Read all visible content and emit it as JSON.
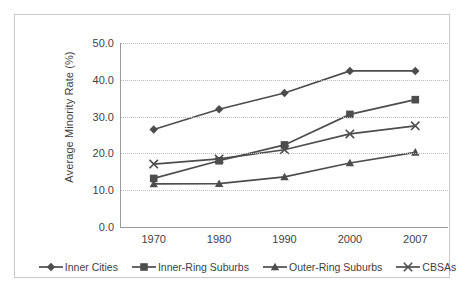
{
  "chart_data": {
    "type": "line",
    "title": "",
    "xlabel": "",
    "ylabel": "Average Minority Rate (%)",
    "categories": [
      "1970",
      "1980",
      "1990",
      "2000",
      "2007"
    ],
    "x": [
      1970,
      1980,
      1990,
      2000,
      2007
    ],
    "ylim": [
      0.0,
      50.0
    ],
    "ytick_labels": [
      "0.0",
      "10.0",
      "20.0",
      "30.0",
      "40.0",
      "50.0"
    ],
    "ytick_values": [
      0.0,
      10.0,
      20.0,
      30.0,
      40.0,
      50.0
    ],
    "grid": "horizontal-dotted",
    "legend_position": "bottom",
    "series": [
      {
        "name": "Inner Cities",
        "marker": "diamond",
        "color": "#4d4d4d",
        "values": [
          26.5,
          32.0,
          36.4,
          42.4,
          42.4
        ]
      },
      {
        "name": "Inner-Ring Suburbs",
        "marker": "square",
        "color": "#4d4d4d",
        "values": [
          13.2,
          18.0,
          22.3,
          30.6,
          34.6
        ]
      },
      {
        "name": "Outer-Ring Suburbs",
        "marker": "triangle",
        "color": "#4d4d4d",
        "values": [
          11.7,
          11.8,
          13.6,
          17.4,
          20.3
        ]
      },
      {
        "name": "CBSAs",
        "marker": "x",
        "color": "#4d4d4d",
        "values": [
          17.1,
          18.5,
          21.0,
          25.3,
          27.5
        ]
      }
    ]
  },
  "style": {
    "line_color": "#4d4d4d",
    "grid_color": "#bdbdbd",
    "axis_color": "#9a9a9a",
    "frame_color": "#c9c9c9",
    "text_color": "#3f3f3f",
    "background": "#ffffff"
  }
}
